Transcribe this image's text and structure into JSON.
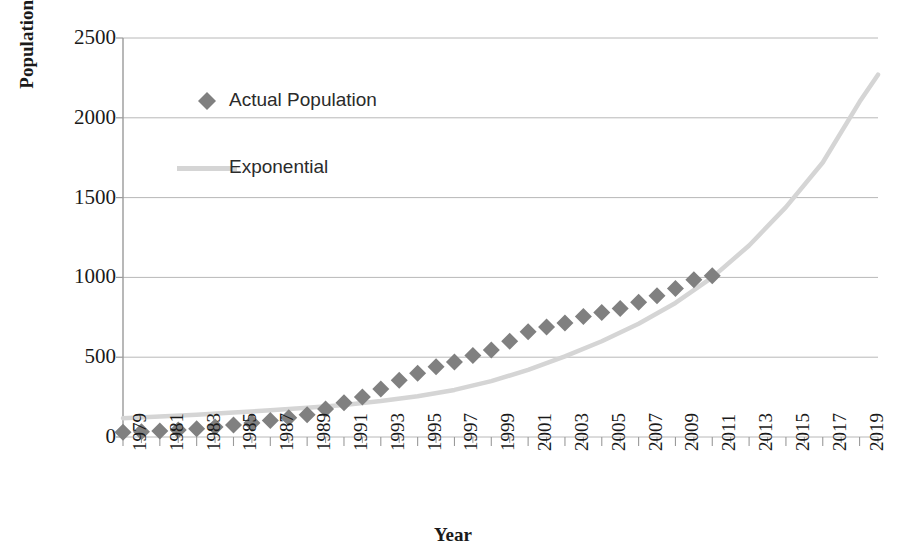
{
  "chart_data": {
    "type": "scatter",
    "title": "",
    "xlabel": "Year",
    "ylabel": "Population [10000 person]",
    "xlim": [
      1979,
      2020
    ],
    "ylim": [
      0,
      2500
    ],
    "grid": true,
    "legend_position": "upper-left-inside",
    "y_ticks": [
      0,
      500,
      1000,
      1500,
      2000,
      2500
    ],
    "y_tick_labels": [
      "0",
      "500",
      "1000",
      "1500",
      "2000",
      "2500"
    ],
    "x_ticks": [
      1979,
      1981,
      1983,
      1985,
      1987,
      1989,
      1991,
      1993,
      1995,
      1997,
      1999,
      2001,
      2003,
      2005,
      2007,
      2009,
      2011,
      2013,
      2015,
      2017,
      2019
    ],
    "x_tick_labels": [
      "1979",
      "1981",
      "1983",
      "1985",
      "1987",
      "1989",
      "1991",
      "1993",
      "1995",
      "1997",
      "1999",
      "2001",
      "2003",
      "2005",
      "2007",
      "2009",
      "2011",
      "2013",
      "2015",
      "2017",
      "2019"
    ],
    "x_minor_tick_step": 1,
    "series": [
      {
        "name": "Actual Population",
        "type": "scatter",
        "marker": "diamond",
        "color": "#808080",
        "x": [
          1979,
          1980,
          1981,
          1982,
          1983,
          1984,
          1985,
          1986,
          1987,
          1988,
          1989,
          1990,
          1991,
          1992,
          1993,
          1994,
          1995,
          1996,
          1997,
          1998,
          1999,
          2000,
          2001,
          2002,
          2003,
          2004,
          2005,
          2006,
          2007,
          2008,
          2009,
          2010,
          2011
        ],
        "values": [
          30,
          33,
          38,
          44,
          52,
          62,
          75,
          88,
          103,
          120,
          140,
          175,
          215,
          250,
          300,
          355,
          400,
          440,
          470,
          510,
          545,
          600,
          660,
          690,
          715,
          755,
          780,
          805,
          845,
          885,
          930,
          985,
          1010
        ]
      },
      {
        "name": "Exponential",
        "type": "line",
        "color": "#d5d5d5",
        "equation_form": "y = a*exp(b*(year-1979))",
        "x": [
          1979,
          1981,
          1983,
          1985,
          1987,
          1989,
          1991,
          1993,
          1995,
          1997,
          1999,
          2001,
          2003,
          2005,
          2007,
          2009,
          2011,
          2013,
          2015,
          2017,
          2019,
          2020
        ],
        "values": [
          118,
          128,
          140,
          153,
          167,
          183,
          201,
          225,
          255,
          295,
          350,
          420,
          505,
          600,
          710,
          840,
          1000,
          1200,
          1440,
          1720,
          2100,
          2270
        ]
      }
    ],
    "legend": [
      {
        "label": "Actual Population",
        "marker": "diamond",
        "color": "#808080"
      },
      {
        "label": "Exponential",
        "marker": "line",
        "color": "#d5d5d5"
      }
    ],
    "axis_color": "#9a9a9a",
    "grid_color": "#b8b8b8",
    "text_color": "#1a1a1a",
    "background": "#ffffff"
  }
}
